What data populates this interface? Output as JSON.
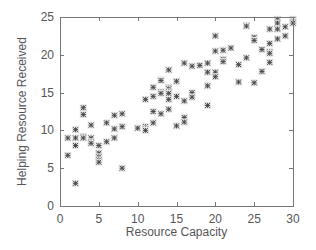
{
  "chart_data": {
    "type": "scatter",
    "title": "",
    "xlabel": "Resource Capacity",
    "ylabel": "Helping Resource Received",
    "xlim": [
      0,
      30
    ],
    "ylim": [
      0,
      25
    ],
    "xticks": [
      0,
      5,
      10,
      15,
      20,
      25,
      30
    ],
    "yticks": [
      0,
      5,
      10,
      15,
      20,
      25
    ],
    "grid": false,
    "legend": null,
    "marker": "asterisk",
    "marker_color": "#4a4a4a",
    "axis_color": "#777777",
    "label_color": "#555555",
    "series": [
      {
        "name": "observations",
        "points": [
          [
            1,
            9.0
          ],
          [
            1,
            6.7
          ],
          [
            2,
            10.1
          ],
          [
            2,
            9.0
          ],
          [
            2,
            8.0
          ],
          [
            2,
            3.0
          ],
          [
            3,
            13.0
          ],
          [
            3,
            12.1
          ],
          [
            3,
            9.2
          ],
          [
            3,
            9.0
          ],
          [
            4,
            10.7
          ],
          [
            4,
            9.0
          ],
          [
            4,
            8.5
          ],
          [
            4,
            8.3
          ],
          [
            5,
            8.0
          ],
          [
            5,
            7.0
          ],
          [
            5,
            6.5
          ],
          [
            5,
            6.1
          ],
          [
            5,
            5.8
          ],
          [
            6,
            11.0
          ],
          [
            6,
            8.5
          ],
          [
            7,
            12.0
          ],
          [
            7,
            10.2
          ],
          [
            7,
            9.0
          ],
          [
            8,
            12.2
          ],
          [
            8,
            10.5
          ],
          [
            8,
            5.0
          ],
          [
            10,
            10.3
          ],
          [
            11,
            14.1
          ],
          [
            11,
            10.5
          ],
          [
            11,
            10.2
          ],
          [
            11,
            10.0
          ],
          [
            12,
            15.7
          ],
          [
            12,
            14.5
          ],
          [
            12,
            12.5
          ],
          [
            12,
            11.0
          ],
          [
            13,
            16.7
          ],
          [
            13,
            16.6
          ],
          [
            13,
            15.1
          ],
          [
            13,
            14.9
          ],
          [
            13,
            12.2
          ],
          [
            14,
            18.0
          ],
          [
            14,
            15.7
          ],
          [
            14,
            15.5
          ],
          [
            14,
            15.1
          ],
          [
            14,
            14.9
          ],
          [
            14,
            14.1
          ],
          [
            14,
            12.8
          ],
          [
            15,
            16.5
          ],
          [
            15,
            14.5
          ],
          [
            15,
            10.6
          ],
          [
            16,
            18.9
          ],
          [
            16,
            13.9
          ],
          [
            16,
            11.7
          ],
          [
            16,
            11.1
          ],
          [
            17,
            18.5
          ],
          [
            17,
            15.0
          ],
          [
            17,
            14.4
          ],
          [
            18,
            18.6
          ],
          [
            19,
            18.9
          ],
          [
            19,
            17.7
          ],
          [
            19,
            15.9
          ],
          [
            19,
            13.3
          ],
          [
            20,
            22.5
          ],
          [
            20,
            20.5
          ],
          [
            20,
            17.7
          ],
          [
            20,
            17.1
          ],
          [
            21,
            20.6
          ],
          [
            21,
            19.4
          ],
          [
            21,
            19.1
          ],
          [
            22,
            20.9
          ],
          [
            23,
            18.7
          ],
          [
            23,
            16.4
          ],
          [
            24,
            23.9
          ],
          [
            24,
            23.8
          ],
          [
            24,
            19.6
          ],
          [
            25,
            22.3
          ],
          [
            25,
            21.9
          ],
          [
            25,
            16.3
          ],
          [
            26,
            20.7
          ],
          [
            26,
            17.8
          ],
          [
            27,
            23.4
          ],
          [
            27,
            21.5
          ],
          [
            27,
            20.4
          ],
          [
            27,
            20.2
          ],
          [
            27,
            19.0
          ],
          [
            28,
            24.7
          ],
          [
            28,
            24.2
          ],
          [
            28,
            23.4
          ],
          [
            28,
            22.1
          ],
          [
            29,
            23.7
          ],
          [
            29,
            22.5
          ],
          [
            30,
            24.7
          ],
          [
            30,
            24.4
          ],
          [
            30,
            24.2
          ]
        ]
      }
    ]
  },
  "layout": {
    "plot_left": 60,
    "plot_right": 293,
    "plot_top": 17,
    "plot_bottom": 206
  }
}
